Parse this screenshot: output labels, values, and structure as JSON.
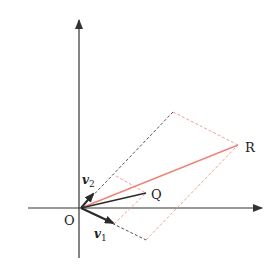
{
  "diagram": {
    "type": "vector-decomposition",
    "colors": {
      "axis": "#333333",
      "vector": "#2a2a2a",
      "dashed_black": "#555555",
      "red": "#f0837a",
      "red_dashed": "#f2a09a"
    },
    "points": {
      "O": {
        "label": "O",
        "x": 81,
        "y": 208
      },
      "Q": {
        "label": "Q",
        "x": 146,
        "y": 193
      },
      "R": {
        "label": "R",
        "x": 238,
        "y": 145
      },
      "P_top": {
        "x": 173,
        "y": 112
      },
      "P_bottom": {
        "x": 146,
        "y": 240
      },
      "q_top": {
        "x": 116,
        "y": 176
      },
      "q_bottom": {
        "x": 114,
        "y": 224
      }
    },
    "vectors": {
      "v1": {
        "label_main": "v",
        "label_sub": "1",
        "tip_x": 113,
        "tip_y": 223
      },
      "v2": {
        "label_main": "v",
        "label_sub": "2",
        "tip_x": 93,
        "tip_y": 194
      }
    },
    "labels": {
      "origin": "O",
      "q": "Q",
      "r": "R",
      "v1_main": "v",
      "v1_sub": "1",
      "v2_main": "v",
      "v2_sub": "2"
    },
    "axes": {
      "x_start": 28,
      "x_end": 262,
      "x_y": 208,
      "y_start": 258,
      "y_end": 20,
      "y_x": 79
    }
  }
}
